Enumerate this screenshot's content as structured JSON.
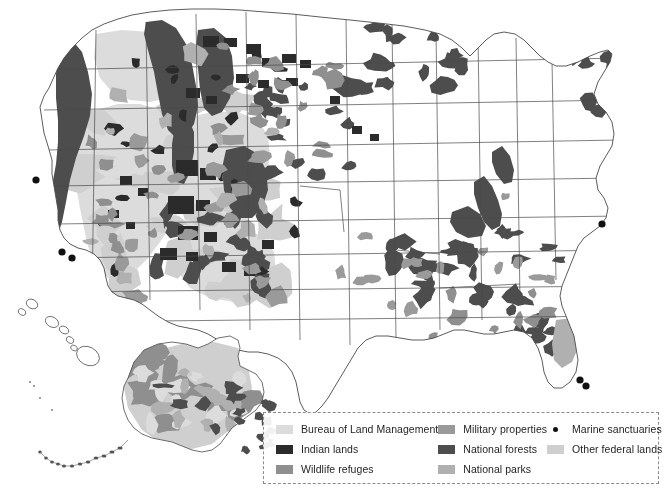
{
  "figure": {
    "type": "thematic-map",
    "projection_note": "Conterminous United States with Alaska and Hawaii insets",
    "background_color": "#ffffff",
    "outline_color": "#4a4a4a"
  },
  "legend": {
    "border_style": "dashed",
    "border_color": "#8c8c8c",
    "columns": [
      {
        "items": [
          {
            "label": "Bureau of Land Management",
            "swatch": "#dcdcdc",
            "icon": "color-swatch"
          },
          {
            "label": "Indian lands",
            "swatch": "#2b2b2b",
            "icon": "color-swatch"
          },
          {
            "label": "Wildlife refuges",
            "swatch": "#8f8f8f",
            "icon": "color-swatch"
          }
        ]
      },
      {
        "items": [
          {
            "label": "Military properties",
            "swatch": "#9a9a9a",
            "icon": "color-swatch"
          },
          {
            "label": "National forests",
            "swatch": "#4d4d4d",
            "icon": "color-swatch"
          },
          {
            "label": "National parks",
            "swatch": "#b0b0b0",
            "icon": "color-swatch"
          }
        ]
      },
      {
        "items": [
          {
            "label": "Marine sanctuaries",
            "swatch": "#111111",
            "icon": "marine-sanctuary-dot"
          },
          {
            "label": "Other federal lands",
            "swatch": "#cfcfcf",
            "icon": "color-swatch"
          }
        ]
      }
    ]
  },
  "map_regions": {
    "conterminous_us": "Lower 48 states shown with state boundary outlines",
    "alaska_inset": "Alaska inset, lower-left-center of figure",
    "hawaii_inset": "Hawaiian island chain inset, left of Alaska",
    "marine_sanctuary_points": 6
  }
}
